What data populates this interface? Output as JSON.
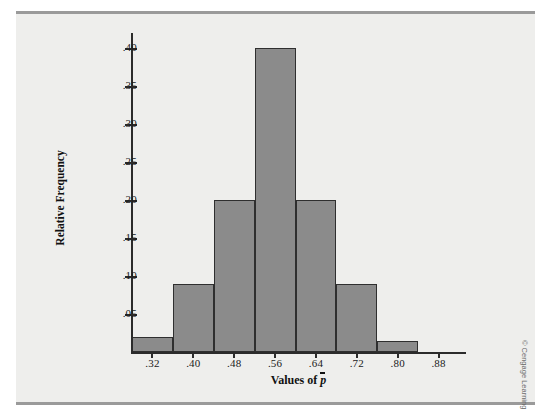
{
  "figure": {
    "credit": "© Cengage Learning"
  },
  "chart_data": {
    "type": "bar",
    "title": "",
    "xlabel_prefix": "Values of ",
    "xlabel_symbol": "p",
    "ylabel": "Relative Frequency",
    "grid": false,
    "legend": "none",
    "bar_fill": "#8b8b8b",
    "bar_edge": "#2f2f2f",
    "xlim": [
      0.28,
      0.92
    ],
    "ylim": [
      0.0,
      0.42
    ],
    "bin_width": 0.08,
    "x_tick_labels": [
      ".32",
      ".40",
      ".48",
      ".56",
      ".64",
      ".72",
      ".80",
      ".88"
    ],
    "x_tick_values": [
      0.32,
      0.4,
      0.48,
      0.56,
      0.64,
      0.72,
      0.8,
      0.88
    ],
    "y_tick_labels": [
      ".05",
      ".10",
      ".15",
      ".20",
      ".25",
      ".30",
      ".35",
      ".40"
    ],
    "y_tick_values": [
      0.05,
      0.1,
      0.15,
      0.2,
      0.25,
      0.3,
      0.35,
      0.4
    ],
    "bins": [
      {
        "left": 0.28,
        "right": 0.36,
        "center": 0.32,
        "value": 0.02
      },
      {
        "left": 0.36,
        "right": 0.44,
        "center": 0.4,
        "value": 0.09
      },
      {
        "left": 0.44,
        "right": 0.52,
        "center": 0.48,
        "value": 0.2
      },
      {
        "left": 0.52,
        "right": 0.6,
        "center": 0.56,
        "value": 0.4
      },
      {
        "left": 0.6,
        "right": 0.68,
        "center": 0.64,
        "value": 0.2
      },
      {
        "left": 0.68,
        "right": 0.76,
        "center": 0.72,
        "value": 0.09
      },
      {
        "left": 0.76,
        "right": 0.84,
        "center": 0.8,
        "value": 0.015
      }
    ],
    "categories": [
      0.32,
      0.4,
      0.48,
      0.56,
      0.64,
      0.72,
      0.8
    ],
    "values": [
      0.02,
      0.09,
      0.2,
      0.4,
      0.2,
      0.09,
      0.015
    ]
  }
}
